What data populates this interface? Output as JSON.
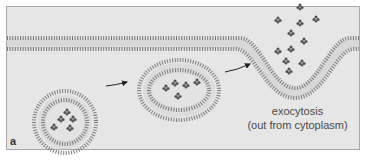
{
  "figure": {
    "panel_label": "a",
    "caption_line1": "exocytosis",
    "caption_line2": "(out from cytoplasm)",
    "colors": {
      "background": "#ffffff",
      "panel_fill": "#e6e6e6",
      "panel_border": "#a8a8a8",
      "lipid_heads": "#7a7a7a",
      "cargo": "#555555",
      "arrow": "#222222",
      "text": "#4a4a4a"
    },
    "elements": {
      "plasma_membrane": "lipid bilayer with exocytosis opening",
      "vesicle_1": "round vesicle with 5 cargo molecules",
      "vesicle_2": "flattened vesicle with 5 cargo molecules approaching membrane",
      "released_cargo": "cargo molecules released outside cell",
      "arrows": 2
    }
  }
}
